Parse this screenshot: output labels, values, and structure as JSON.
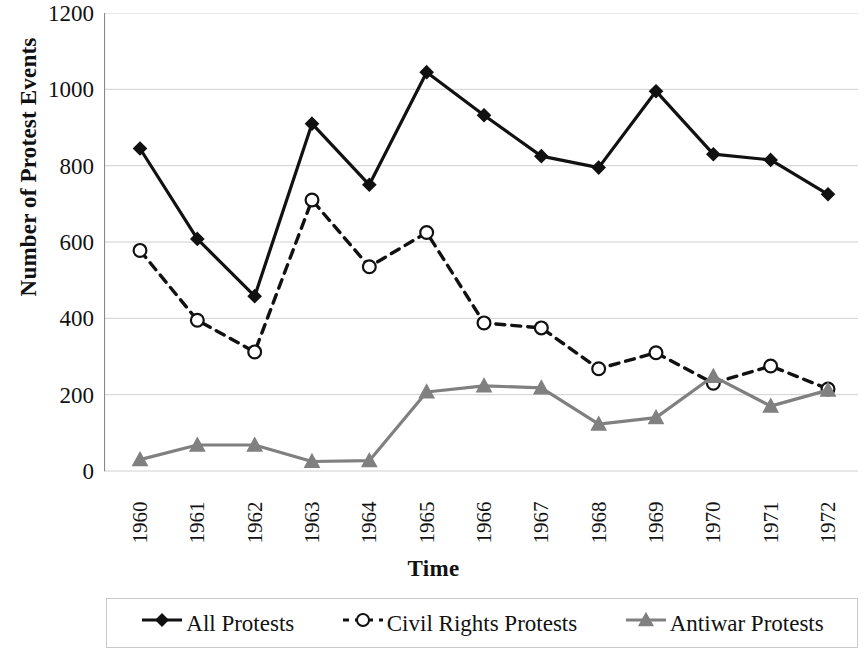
{
  "chart_data": {
    "type": "line",
    "title": "",
    "xlabel": "Time",
    "ylabel": "Number of Protest Events",
    "categories": [
      "1960",
      "1961",
      "1962",
      "1963",
      "1964",
      "1965",
      "1966",
      "1967",
      "1968",
      "1969",
      "1970",
      "1971",
      "1972"
    ],
    "x": [
      1960,
      1961,
      1962,
      1963,
      1964,
      1965,
      1966,
      1967,
      1968,
      1969,
      1970,
      1971,
      1972
    ],
    "ylim": [
      0,
      1200
    ],
    "yticks": [
      0,
      200,
      400,
      600,
      800,
      1000,
      1200
    ],
    "ytick_labels": [
      "0",
      "200",
      "400",
      "600",
      "800",
      "1000",
      "1200"
    ],
    "grid": true,
    "grid_axis": "y",
    "legend_position": "bottom",
    "series": [
      {
        "name": "All Protests",
        "marker": "filled-diamond",
        "line_style": "solid",
        "color": "#111111",
        "values": [
          845,
          608,
          458,
          910,
          750,
          1045,
          932,
          825,
          795,
          995,
          830,
          815,
          725
        ]
      },
      {
        "name": "Civil Rights Protests",
        "marker": "open-circle",
        "line_style": "dashed",
        "color": "#111111",
        "values": [
          578,
          395,
          312,
          710,
          535,
          625,
          388,
          375,
          268,
          310,
          230,
          275,
          215
        ]
      },
      {
        "name": "Antiwar Protests",
        "marker": "filled-triangle",
        "line_style": "solid",
        "color": "#808080",
        "values": [
          30,
          68,
          68,
          25,
          27,
          207,
          223,
          218,
          123,
          140,
          248,
          170,
          212
        ]
      }
    ]
  },
  "axes": {
    "y_title": "Number of Protest Events",
    "x_title": "Time"
  },
  "legend": {
    "items": [
      {
        "label": "All Protests",
        "marker": "filled-diamond",
        "line_style": "solid",
        "color": "#111111"
      },
      {
        "label": "Civil Rights Protests",
        "marker": "open-circle",
        "line_style": "dashed",
        "color": "#111111"
      },
      {
        "label": "Antiwar Protests",
        "marker": "filled-triangle",
        "line_style": "solid",
        "color": "#808080"
      }
    ]
  },
  "style": {
    "background": "#ffffff",
    "gridline_color": "#d0d0d0",
    "axis_color": "#8a8a8a"
  }
}
